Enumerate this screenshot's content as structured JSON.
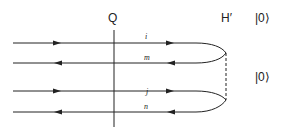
{
  "diagram": {
    "labels": {
      "q": "Q",
      "h_prime": "H′",
      "ket_top": "|0⟩",
      "ket_bottom": "|0⟩"
    },
    "lines": [
      {
        "label": "i",
        "direction": "right"
      },
      {
        "label": "m",
        "direction": "left"
      },
      {
        "label": "j",
        "direction": "right"
      },
      {
        "label": "n",
        "direction": "left"
      }
    ],
    "colors": {
      "stroke": "#222222"
    }
  }
}
